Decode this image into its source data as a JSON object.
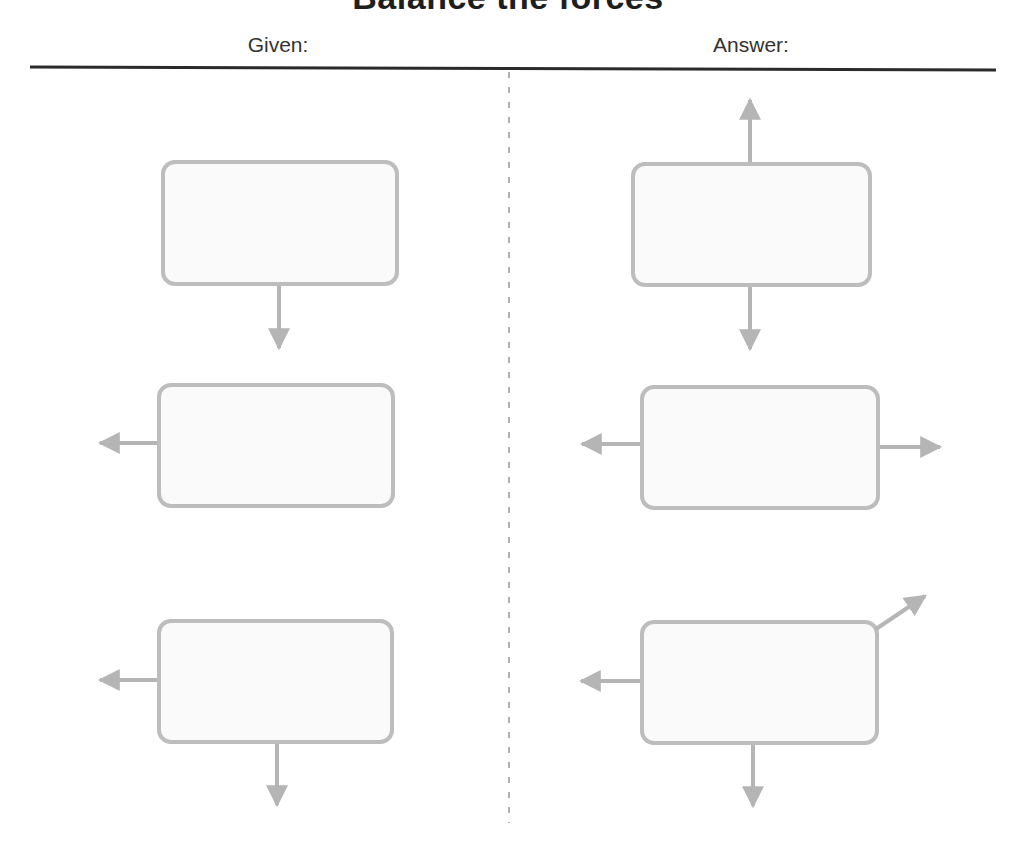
{
  "title": "Balance the forces",
  "columns": {
    "given": {
      "label": "Given:"
    },
    "answer": {
      "label": "Answer:"
    }
  },
  "colors": {
    "box_stroke": "#bdbdbd",
    "box_fill": "#fafafa",
    "arrow": "#b5b5b5",
    "rule": "#2b2b2b",
    "divider": "#b0b0b0",
    "title": "#1e1e1e",
    "label": "#333333"
  },
  "given": [
    {
      "box": {
        "x": 163,
        "y": 162,
        "w": 234,
        "h": 122
      },
      "forces": [
        "down"
      ]
    },
    {
      "box": {
        "x": 159,
        "y": 385,
        "w": 234,
        "h": 121
      },
      "forces": [
        "left"
      ]
    },
    {
      "box": {
        "x": 159,
        "y": 621,
        "w": 233,
        "h": 121
      },
      "forces": [
        "left",
        "down"
      ]
    }
  ],
  "answer": [
    {
      "box": {
        "x": 633,
        "y": 164,
        "w": 237,
        "h": 121
      },
      "forces": [
        "up",
        "down"
      ]
    },
    {
      "box": {
        "x": 642,
        "y": 387,
        "w": 236,
        "h": 121
      },
      "forces": [
        "left",
        "right"
      ]
    },
    {
      "box": {
        "x": 642,
        "y": 622,
        "w": 235,
        "h": 121
      },
      "forces": [
        "left",
        "down",
        "up-right"
      ]
    }
  ]
}
